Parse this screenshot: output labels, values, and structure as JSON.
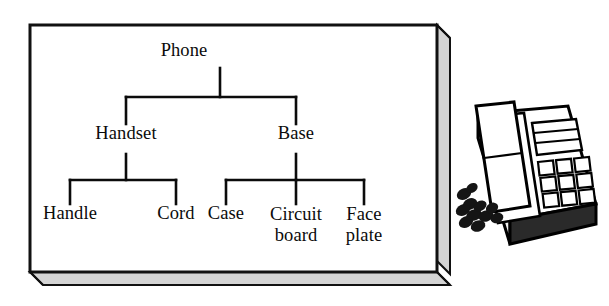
{
  "figure": {
    "kind": "hierarchy-tree-diagram",
    "panel": {
      "face_color": "#ffffff",
      "side_color": "#d2d2d2",
      "border_color": "#111111"
    }
  },
  "tree": {
    "root": {
      "id": "phone",
      "label": "Phone"
    },
    "level1": [
      {
        "id": "handset",
        "label": "Handset"
      },
      {
        "id": "base",
        "label": "Base"
      }
    ],
    "level2": [
      {
        "id": "handle",
        "label": "Handle",
        "parent": "handset"
      },
      {
        "id": "cord",
        "label": "Cord",
        "parent": "handset"
      },
      {
        "id": "case",
        "label": "Case",
        "parent": "base"
      },
      {
        "id": "circuit-board",
        "label": "Circuit board",
        "line1": "Circuit",
        "line2": "board",
        "parent": "base"
      },
      {
        "id": "face-plate",
        "label": "Face plate",
        "line1": "Face",
        "line2": "plate",
        "parent": "base"
      }
    ]
  },
  "illustration": {
    "name": "desk-telephone",
    "parts": {
      "handset": "handset",
      "coiled_cord": "coiled-cord",
      "display": "display-panel",
      "keypad": "keypad-3x4",
      "base": "base-body"
    },
    "colors": {
      "outline": "#000000",
      "body": "#ffffff",
      "shadow": "#e8e8e8",
      "dark": "#1a1a1a"
    }
  }
}
